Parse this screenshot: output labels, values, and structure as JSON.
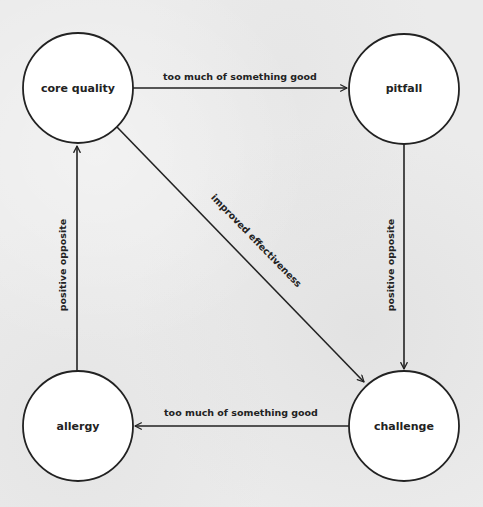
{
  "diagram": {
    "colors": {
      "background": "#ebebeb",
      "node_fill": "#ffffff",
      "stroke": "#222222",
      "text": "#222222"
    },
    "nodes": [
      {
        "id": "core_quality",
        "label": "core quality",
        "cx": 78,
        "cy": 88,
        "r": 55
      },
      {
        "id": "pitfall",
        "label": "pitfall",
        "cx": 404,
        "cy": 89,
        "r": 55
      },
      {
        "id": "allergy",
        "label": "allergy",
        "cx": 78,
        "cy": 426,
        "r": 55
      },
      {
        "id": "challenge",
        "label": "challenge",
        "cx": 404,
        "cy": 426,
        "r": 55
      }
    ],
    "edges": [
      {
        "from": "core_quality",
        "to": "pitfall",
        "label": "too much of something good"
      },
      {
        "from": "pitfall",
        "to": "challenge",
        "label": "positive opposite"
      },
      {
        "from": "core_quality",
        "to": "challenge",
        "label": "improved effectiveness"
      },
      {
        "from": "challenge",
        "to": "allergy",
        "label": "too much of something good"
      },
      {
        "from": "allergy",
        "to": "core_quality",
        "label": "positive opposite"
      }
    ]
  }
}
